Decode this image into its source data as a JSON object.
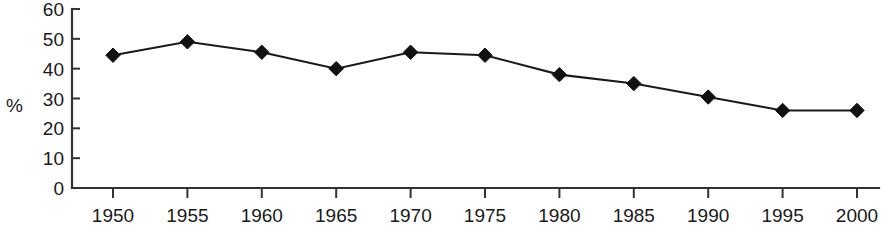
{
  "chart_data": {
    "type": "line",
    "title": "",
    "subtitle": "",
    "xlabel": "",
    "ylabel": "%",
    "categories": [
      "1950",
      "1955",
      "1960",
      "1965",
      "1970",
      "1975",
      "1980",
      "1985",
      "1990",
      "1995",
      "2000"
    ],
    "x": [
      1950,
      1955,
      1960,
      1965,
      1970,
      1975,
      1980,
      1985,
      1990,
      1995,
      2000
    ],
    "values": [
      44.5,
      49,
      45.5,
      40,
      45.5,
      44.5,
      38,
      35,
      30.5,
      26,
      26
    ],
    "series": [
      {
        "name": "",
        "values": [
          44.5,
          49,
          45.5,
          40,
          45.5,
          44.5,
          38,
          35,
          30.5,
          26,
          26
        ],
        "marker": "diamond",
        "color": "#111111"
      }
    ],
    "xlim": [
      1950,
      2000
    ],
    "ylim": [
      0,
      60
    ],
    "yticks": [
      0,
      10,
      20,
      30,
      40,
      50,
      60
    ],
    "ytick_labels": [
      "0",
      "10",
      "20",
      "30",
      "40",
      "50",
      "60"
    ],
    "xticks": [
      1950,
      1955,
      1960,
      1965,
      1970,
      1975,
      1980,
      1985,
      1990,
      1995,
      2000
    ],
    "xtick_labels": [
      "1950",
      "1955",
      "1960",
      "1965",
      "1970",
      "1975",
      "1980",
      "1985",
      "1990",
      "1995",
      "2000"
    ],
    "grid": false,
    "legend": false,
    "legend_position": "none",
    "annotations": []
  },
  "axis_label_y": "%",
  "colors": {
    "line": "#111111",
    "marker": "#111111",
    "axis": "#333333",
    "text": "#1a1a1a",
    "background": "#ffffff"
  }
}
